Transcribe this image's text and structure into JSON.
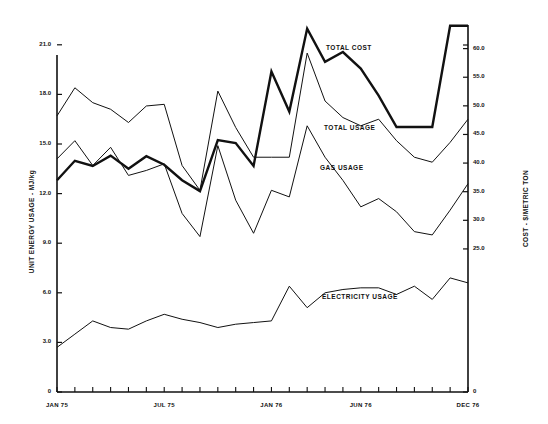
{
  "chart_data": {
    "type": "line",
    "title": "",
    "subtitle": "",
    "xlabel": "",
    "ylabel": "UNIT ENERGY USAGE - MJ/kg",
    "y2label": "COST - $/METRIC TON",
    "grid": false,
    "legend_position": "inline-annotations",
    "x": [
      "JAN 75",
      "FEB 75",
      "MAR 75",
      "APR 75",
      "MAY 75",
      "JUN 75",
      "JUL 75",
      "AUG 75",
      "SEP 75",
      "OCT 75",
      "NOV 75",
      "DEC 75",
      "JAN 76",
      "FEB 76",
      "MAR 76",
      "APR 76",
      "MAY 76",
      "JUN 76",
      "JUL 76",
      "AUG 76",
      "SEP 76",
      "OCT 76",
      "NOV 76",
      "DEC 76"
    ],
    "xtick_labels": [
      "JAN 75",
      "JUL 75",
      "JAN 76",
      "JUN 76",
      "DEC 76"
    ],
    "xtick_positions": [
      0,
      6,
      12,
      17,
      23
    ],
    "xlim": [
      0,
      23
    ],
    "ylim": [
      0,
      22.5
    ],
    "ytick_labels": [
      "0",
      "3.0",
      "6.0",
      "9.0",
      "12.0",
      "15.0",
      "18.0",
      "21.0"
    ],
    "ytick_values": [
      0,
      3.0,
      6.0,
      9.0,
      12.0,
      15.0,
      18.0,
      21.0
    ],
    "y2lim": [
      0,
      65.0
    ],
    "y2tick_labels": [
      "0",
      "25.0",
      "30.0",
      "35.0",
      "40.0",
      "45.0",
      "50.0",
      "55.0",
      "60.0"
    ],
    "y2tick_values": [
      0,
      25.0,
      30.0,
      35.0,
      40.0,
      45.0,
      50.0,
      55.0,
      60.0
    ],
    "series": [
      {
        "name": "TOTAL COST",
        "axis": "right",
        "units": "$/METRIC TON",
        "line_width": 2.4,
        "color": "#111111",
        "values": [
          37.0,
          40.4,
          39.5,
          41.3,
          39.0,
          41.2,
          39.7,
          37.0,
          35.1,
          44.0,
          43.5,
          39.5,
          56.0,
          49.0,
          63.5,
          57.7,
          59.4,
          56.5,
          51.8,
          46.3,
          46.3,
          46.3,
          64.0,
          64.0
        ]
      },
      {
        "name": "TOTAL USAGE",
        "axis": "left",
        "units": "MJ/kg",
        "line_width": 1.0,
        "color": "#111111",
        "values": [
          16.7,
          18.4,
          17.5,
          17.1,
          16.3,
          17.3,
          17.4,
          13.7,
          12.2,
          18.2,
          16.0,
          14.2,
          14.2,
          14.2,
          20.5,
          17.6,
          16.6,
          16.1,
          16.5,
          15.2,
          14.2,
          13.9,
          15.1,
          16.5
        ]
      },
      {
        "name": "GAS USAGE",
        "axis": "left",
        "units": "MJ/kg",
        "line_width": 1.0,
        "color": "#111111",
        "values": [
          14.1,
          15.2,
          13.7,
          14.8,
          13.1,
          13.4,
          13.8,
          10.8,
          9.4,
          14.9,
          11.6,
          9.6,
          12.2,
          11.8,
          16.1,
          14.2,
          12.8,
          11.2,
          11.7,
          10.9,
          9.7,
          9.5,
          11.0,
          12.6
        ]
      },
      {
        "name": "ELECTRICITY USAGE",
        "axis": "left",
        "units": "MJ/kg",
        "line_width": 1.0,
        "color": "#111111",
        "values": [
          2.7,
          3.5,
          4.3,
          3.9,
          3.8,
          4.3,
          4.7,
          4.4,
          4.2,
          3.9,
          4.1,
          4.2,
          4.3,
          6.4,
          5.1,
          6.0,
          6.2,
          6.3,
          6.3,
          5.9,
          6.4,
          5.6,
          6.9,
          6.6
        ]
      }
    ],
    "annotations": [
      {
        "text": "TOTAL COST",
        "x_px": 326,
        "y_px": 44
      },
      {
        "text": "TOTAL USAGE",
        "x_px": 324,
        "y_px": 124
      },
      {
        "text": "GAS USAGE",
        "x_px": 320,
        "y_px": 164
      },
      {
        "text": "ELECTRICITY USAGE",
        "x_px": 322,
        "y_px": 293
      }
    ]
  },
  "axes": {
    "y_left_title": "UNIT ENERGY USAGE - MJ/kg",
    "y_right_title": "COST - $/METRIC TON"
  }
}
